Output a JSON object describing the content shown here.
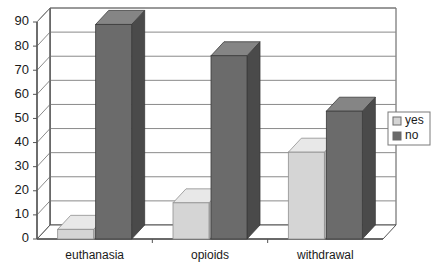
{
  "chart_data": {
    "type": "bar",
    "title": "",
    "subtitle": "",
    "xlabel": "",
    "ylabel": "",
    "categories": [
      "euthanasia",
      "opioids",
      "withdrawal"
    ],
    "series": [
      {
        "name": "yes",
        "values": [
          4,
          15,
          36
        ],
        "color": "#d5d5d5"
      },
      {
        "name": "no",
        "values": [
          89,
          76,
          53
        ],
        "color": "#6b6b6b"
      }
    ],
    "ylim": [
      0,
      90
    ],
    "yticks": [
      0,
      10,
      20,
      30,
      40,
      50,
      60,
      70,
      80,
      90
    ],
    "ytick_labels": [
      "0",
      "10",
      "20",
      "30",
      "40",
      "50",
      "60",
      "70",
      "80",
      "90"
    ],
    "grid": true,
    "grid_axis": "y",
    "legend_position": "right",
    "style": "3d-column",
    "colors": {
      "bar_yes_face": "#d5d5d5",
      "bar_yes_top": "#e8e8e8",
      "bar_yes_side": "#b5b5b5",
      "bar_no_face": "#6b6b6b",
      "bar_no_top": "#858585",
      "bar_no_side": "#4a4a4a",
      "grid_line": "#8a8a8a",
      "axis_line": "#555555",
      "plot_background": "#ffffff",
      "text": "#1a1a1a"
    }
  },
  "legend": {
    "items": [
      {
        "label": "yes",
        "swatch": "#d5d5d5"
      },
      {
        "label": "no",
        "swatch": "#6b6b6b"
      }
    ]
  }
}
